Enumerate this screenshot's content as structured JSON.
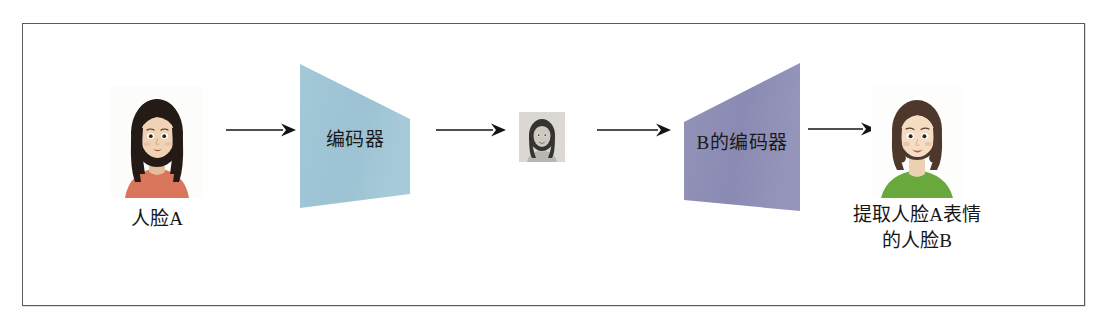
{
  "figure": {
    "frame": {
      "border_color": "#5a5a5a",
      "background": "#ffffff"
    }
  },
  "nodes": {
    "face_a": {
      "name": "人脸A",
      "caption": "人脸A",
      "kind": "photo",
      "hair_color": "#241a16",
      "skin_color": "#efd3b4",
      "clothing_color": "#d9755a",
      "background_color": "#fdfdfd"
    },
    "encoder": {
      "label": "编码器",
      "kind": "trapezoid",
      "fill_color": "#9dc3d4",
      "orientation": "narrowing-right"
    },
    "latent": {
      "name": "latent-face-thumbnail",
      "kind": "photo-grayscale",
      "caption": "",
      "hair_color": "#2b2b2b",
      "background_color": "#d8d8d4"
    },
    "decoder_b": {
      "label": "B的编码器",
      "kind": "trapezoid",
      "fill_color": "#8d8cb5",
      "orientation": "widening-right"
    },
    "face_b": {
      "name": "人脸B",
      "caption_line1": "提取人脸A表情",
      "caption_line2": "的人脸B",
      "kind": "photo",
      "hair_color": "#4e382b",
      "skin_color": "#f5ddc4",
      "clothing_color": "#69a83c",
      "background_color": "#fdfdfd"
    }
  },
  "arrows": {
    "a1": {
      "from": "人脸A",
      "to": "编码器",
      "label": ""
    },
    "a2": {
      "from": "编码器",
      "to": "latent-face-thumbnail",
      "label": ""
    },
    "a3": {
      "from": "latent-face-thumbnail",
      "to": "B的编码器",
      "label": ""
    },
    "a4": {
      "from": "B的编码器",
      "to": "人脸B",
      "label": ""
    },
    "color": "#141414"
  }
}
